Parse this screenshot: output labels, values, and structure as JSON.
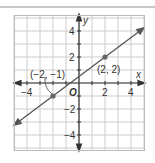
{
  "chart_data": {
    "type": "line",
    "title": "",
    "xlabel": "x",
    "ylabel": "y",
    "xlim": [
      -5,
      5
    ],
    "ylim": [
      -5,
      5
    ],
    "grid": true,
    "x_ticks": [
      -4,
      2,
      4
    ],
    "y_ticks": [
      4,
      2,
      -2,
      -4
    ],
    "tick_labels": {
      "x": [
        "−4",
        "2",
        "4"
      ],
      "y": [
        "4",
        "2",
        "−2",
        "−4"
      ]
    },
    "origin_label": "O",
    "series": [
      {
        "name": "line",
        "equation": "y = 0.75x + 0.5",
        "x": [
          -5,
          5
        ],
        "y": [
          -3.25,
          4.25
        ],
        "color": "#555555"
      }
    ],
    "points": [
      {
        "x": -2,
        "y": -1,
        "label": "(−2, −1)"
      },
      {
        "x": 2,
        "y": 2,
        "label": "(2, 2)"
      }
    ],
    "colors": {
      "grid": "#cccccc",
      "axis": "#333333",
      "line": "#555555",
      "point": "#666666"
    }
  }
}
